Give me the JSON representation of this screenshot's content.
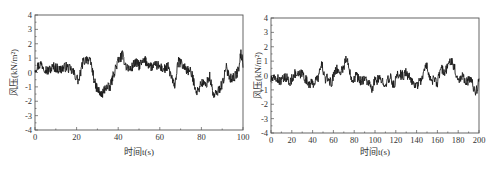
{
  "chart_data": [
    {
      "type": "line",
      "title": "",
      "xlabel": "时间t(s)",
      "ylabel": "风压(kN/m²)",
      "xlim": [
        0,
        100
      ],
      "ylim": [
        -4,
        4
      ],
      "xticks": [
        0,
        20,
        40,
        60,
        80,
        100
      ],
      "yticks": [
        4,
        3,
        2,
        1,
        0,
        -1,
        -2,
        -3,
        -4
      ],
      "grid": false,
      "legend": "none",
      "series": [
        {
          "name": "wind pressure",
          "keypoints_x": [
            0,
            3,
            6,
            9,
            12,
            15,
            18,
            21,
            23,
            25,
            27,
            29,
            32,
            34,
            36,
            38,
            40,
            42,
            44,
            46,
            48,
            50,
            53,
            56,
            59,
            62,
            64,
            66,
            67,
            69,
            71,
            73,
            75,
            78,
            80,
            82,
            84,
            86,
            88,
            90,
            92,
            94,
            96,
            98,
            99,
            100
          ],
          "keypoints_y": [
            0.3,
            0.6,
            0.1,
            0.4,
            0.2,
            0.4,
            0.1,
            -0.6,
            0.7,
            1.0,
            0.6,
            -0.9,
            -1.6,
            -1.0,
            -1.1,
            0.0,
            0.8,
            1.2,
            0.4,
            0.2,
            0.7,
            0.5,
            0.8,
            0.4,
            0.5,
            0.2,
            0.4,
            -0.5,
            -1.0,
            0.8,
            0.5,
            0.2,
            0.0,
            -1.4,
            -0.7,
            -0.9,
            -0.3,
            -1.7,
            -1.3,
            -0.8,
            0.3,
            -0.4,
            -0.3,
            0.2,
            1.4,
            0.6
          ]
        }
      ]
    },
    {
      "type": "line",
      "title": "",
      "xlabel": "时间t(s)",
      "ylabel": "风压(kN/m²)",
      "xlim": [
        0,
        200
      ],
      "ylim": [
        -4,
        4
      ],
      "xticks": [
        0,
        20,
        40,
        60,
        80,
        100,
        120,
        140,
        160,
        180,
        200
      ],
      "yticks": [
        4,
        3,
        2,
        1,
        0,
        -1,
        -2,
        -3,
        -4
      ],
      "grid": false,
      "legend": "none",
      "series": [
        {
          "name": "wind pressure",
          "keypoints_x": [
            0,
            5,
            10,
            15,
            18,
            22,
            27,
            30,
            35,
            40,
            45,
            49,
            52,
            55,
            58,
            62,
            66,
            70,
            72,
            75,
            78,
            82,
            86,
            90,
            94,
            97,
            100,
            105,
            110,
            115,
            118,
            122,
            127,
            130,
            135,
            140,
            145,
            150,
            153,
            156,
            160,
            163,
            167,
            170,
            173,
            176,
            180,
            184,
            188,
            192,
            197,
            200
          ],
          "keypoints_y": [
            -0.3,
            -0.2,
            -0.4,
            -0.1,
            -0.6,
            0.1,
            0.0,
            0.2,
            -0.5,
            -0.6,
            -0.2,
            0.8,
            -0.3,
            -0.2,
            -0.6,
            0.5,
            0.2,
            0.6,
            1.2,
            0.6,
            -0.3,
            0.0,
            -0.4,
            -0.2,
            -0.5,
            -1.1,
            -0.3,
            -0.3,
            -0.5,
            -0.2,
            -0.7,
            0.1,
            0.0,
            0.2,
            -0.4,
            -0.7,
            -0.2,
            0.8,
            -0.3,
            -0.3,
            -0.6,
            0.5,
            0.2,
            0.6,
            1.2,
            0.6,
            -0.3,
            0.0,
            -0.4,
            -0.3,
            -1.2,
            -0.4
          ]
        }
      ]
    }
  ]
}
